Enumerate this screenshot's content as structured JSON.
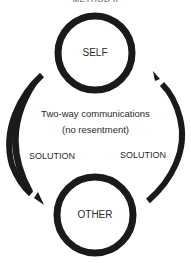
{
  "diagram": {
    "title": "METHOD II",
    "nodes": [
      {
        "id": "self",
        "label": "SELF"
      },
      {
        "id": "other",
        "label": "OTHER"
      }
    ],
    "center_text": {
      "line1": "Two-way communications",
      "line2": "(no resentment)"
    },
    "edges": [
      {
        "from": "self",
        "to": "other",
        "label": "SOLUTION",
        "side": "left"
      },
      {
        "from": "other",
        "to": "self",
        "label": "SOLUTION",
        "side": "right"
      }
    ],
    "colors": {
      "stroke": "#1a1a1a",
      "background": "#ffffff",
      "text": "#2a2a2a"
    }
  }
}
